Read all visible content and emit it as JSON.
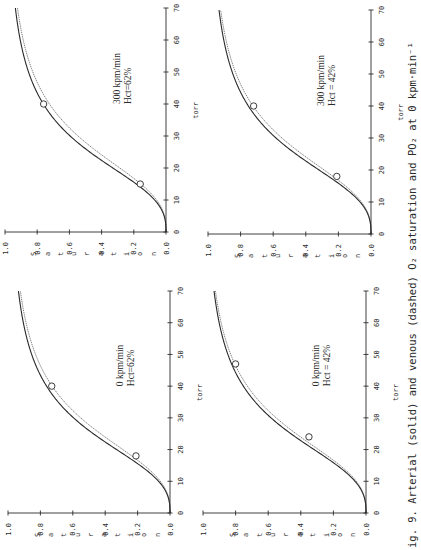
{
  "figure": {
    "caption": "ig. 9.  Arterial (solid) and venous (dashed) O₂ saturation and PO₂ at 0 kpm·min⁻¹",
    "orientation": "rotated 90° counter-clockwise (text reads bottom-to-top)",
    "ink_color": "#2a2a2a",
    "background": "#ffffff"
  },
  "chart_data": [
    {
      "type": "line",
      "panel": "top-left",
      "annotation": [
        "300  kpm/min",
        "Hct=62%"
      ],
      "xlabel": "torr",
      "ylabel": "Saturation",
      "xlim": [
        0,
        70
      ],
      "ylim": [
        0.0,
        1.0
      ],
      "xticks": [
        0,
        10,
        20,
        30,
        40,
        50,
        60,
        70
      ],
      "yticks": [
        "0.0",
        "0.2",
        "0.4",
        "0.6",
        "0.8",
        "1.0"
      ],
      "grid": false,
      "series": [
        {
          "name": "Arterial (solid)",
          "style": "solid",
          "p50": 26.0,
          "hill_n": 2.7
        },
        {
          "name": "Venous (dashed)",
          "style": "dashed",
          "p50": 28.0,
          "hill_n": 2.7
        }
      ],
      "points": [
        {
          "x": 15,
          "y": 0.16
        },
        {
          "x": 40,
          "y": 0.76
        }
      ],
      "geometry": {
        "sat0_x": 166,
        "sat1_x": 5,
        "torr0_y": 232,
        "torr70_y": 8
      }
    },
    {
      "type": "line",
      "panel": "top-right",
      "annotation": [
        "300  kpm/min",
        "Hct  =  42%"
      ],
      "xlabel": "torr",
      "ylabel": "Saturation",
      "xlim": [
        0,
        70
      ],
      "ylim": [
        0.0,
        1.0
      ],
      "xticks": [
        0,
        10,
        20,
        30,
        40,
        50,
        60,
        70
      ],
      "yticks": [
        "0.0",
        "0.2",
        "0.4",
        "0.6",
        "0.8",
        "1.0"
      ],
      "grid": false,
      "series": [
        {
          "name": "Arterial (solid)",
          "style": "solid",
          "p50": 26.5,
          "hill_n": 2.7
        },
        {
          "name": "Venous (dashed)",
          "style": "dashed",
          "p50": 28.0,
          "hill_n": 2.7
        }
      ],
      "points": [
        {
          "x": 18,
          "y": 0.21
        },
        {
          "x": 40,
          "y": 0.72
        }
      ],
      "geometry": {
        "sat0_x": 371,
        "sat1_x": 208,
        "torr0_y": 234,
        "torr70_y": 10
      }
    },
    {
      "type": "line",
      "panel": "bottom-left",
      "annotation": [
        "0  kpm/min",
        "Hct=62%"
      ],
      "xlabel": "torr",
      "ylabel": "Saturation",
      "xlim": [
        0,
        70
      ],
      "ylim": [
        0.0,
        1.0
      ],
      "xticks": [
        0,
        10,
        20,
        30,
        40,
        50,
        60,
        70
      ],
      "yticks": [
        "0.0",
        "0.2",
        "0.4",
        "0.6",
        "0.8",
        "1.0"
      ],
      "grid": false,
      "series": [
        {
          "name": "Arterial (solid)",
          "style": "solid",
          "p50": 26.0,
          "hill_n": 2.7
        },
        {
          "name": "Venous (dashed)",
          "style": "dashed",
          "p50": 27.8,
          "hill_n": 2.7
        }
      ],
      "points": [
        {
          "x": 18,
          "y": 0.21
        },
        {
          "x": 40,
          "y": 0.73
        }
      ],
      "geometry": {
        "sat0_x": 170,
        "sat1_x": 8,
        "torr0_y": 513,
        "torr70_y": 291
      }
    },
    {
      "type": "line",
      "panel": "bottom-right",
      "annotation": [
        "0  kpm/min",
        "Hct  =  42%"
      ],
      "xlabel": "torr",
      "ylabel": "Saturation",
      "xlim": [
        0,
        70
      ],
      "ylim": [
        0.0,
        1.0
      ],
      "xticks": [
        0,
        10,
        20,
        30,
        40,
        50,
        60,
        70
      ],
      "yticks": [
        "0.0",
        "0.2",
        "0.4",
        "0.6",
        "0.8",
        "1.0"
      ],
      "grid": false,
      "series": [
        {
          "name": "Arterial (solid)",
          "style": "solid",
          "p50": 26.5,
          "hill_n": 2.7
        },
        {
          "name": "Venous (dashed)",
          "style": "dashed",
          "p50": 27.8,
          "hill_n": 2.7
        }
      ],
      "points": [
        {
          "x": 24,
          "y": 0.35
        },
        {
          "x": 47,
          "y": 0.8
        }
      ],
      "geometry": {
        "sat0_x": 366,
        "sat1_x": 203,
        "torr0_y": 513,
        "torr70_y": 291
      }
    }
  ]
}
